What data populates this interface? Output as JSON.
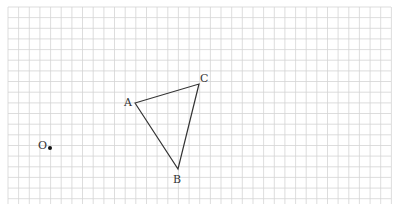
{
  "diagram": {
    "type": "geometry-grid",
    "grid": {
      "x0": 8,
      "y0": 7,
      "x1": 391,
      "y1": 204,
      "spacing": 10.65,
      "line_color": "#d4d4d4"
    },
    "points": {
      "O": {
        "label": "O",
        "x": 50,
        "y": 148,
        "lx": 38,
        "ly": 149
      },
      "A": {
        "label": "A",
        "x": 135,
        "y": 103,
        "lx": 124,
        "ly": 106
      },
      "B": {
        "label": "B",
        "x": 178,
        "y": 169,
        "lx": 173,
        "ly": 183
      },
      "C": {
        "label": "C",
        "x": 199,
        "y": 84,
        "lx": 200,
        "ly": 82
      }
    },
    "triangle": [
      "A",
      "B",
      "C"
    ],
    "stroke_color": "#333333"
  }
}
